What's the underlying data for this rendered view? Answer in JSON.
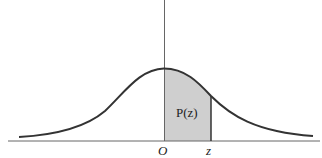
{
  "diagram": {
    "type": "normal-distribution-curve",
    "shaded_region_label": "P(z)",
    "axis_labels": {
      "origin": "O",
      "z_point": "z"
    },
    "colors": {
      "curve": "#333333",
      "axis": "#555555",
      "shading": "#cfcfcf",
      "background": "#ffffff"
    }
  }
}
